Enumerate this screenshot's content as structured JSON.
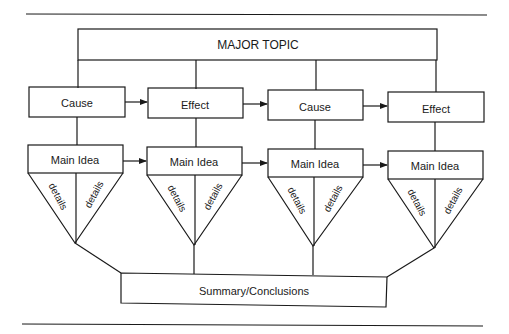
{
  "diagram": {
    "major_topic": "MAJOR TOPIC",
    "row1": [
      {
        "label": "Cause"
      },
      {
        "label": "Effect"
      },
      {
        "label": "Cause"
      },
      {
        "label": "Effect"
      }
    ],
    "row2": [
      {
        "label": "Main Idea",
        "details_left": "details",
        "details_right": "details"
      },
      {
        "label": "Main Idea",
        "details_left": "details",
        "details_right": "details"
      },
      {
        "label": "Main Idea",
        "details_left": "details",
        "details_right": "details"
      },
      {
        "label": "Main Idea",
        "details_left": "details",
        "details_right": "details"
      }
    ],
    "summary": "Summary/Conclusions",
    "colors": {
      "ink": "#1a1a1a",
      "background": "#ffffff"
    }
  }
}
